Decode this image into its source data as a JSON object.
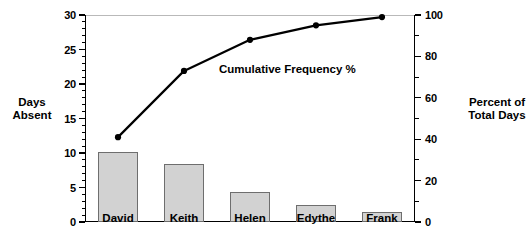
{
  "chart_data": {
    "type": "bar",
    "title": "",
    "categories": [
      "David",
      "Keith",
      "Helen",
      "Edythe",
      "Frank"
    ],
    "series": [
      {
        "name": "Days Absent",
        "type": "bar",
        "axis": "left",
        "values": [
          10.2,
          8.4,
          4.3,
          2.5,
          1.4
        ]
      },
      {
        "name": "Cumulative Frequency %",
        "type": "line",
        "axis": "right",
        "values": [
          41,
          73,
          88,
          95,
          99
        ]
      }
    ],
    "xlabel": "",
    "ylabel": "Days Absent",
    "y2label": "Percent of Total Days",
    "ylim": [
      0,
      30
    ],
    "y2lim": [
      0,
      100
    ],
    "yticks": [
      0,
      5,
      10,
      15,
      20,
      25,
      30
    ],
    "y2ticks": [
      0,
      20,
      40,
      60,
      80,
      100
    ],
    "yminor_step": 1,
    "y2minor_step": 10,
    "grid": false,
    "legend": "none",
    "annotations": [
      {
        "text": "Cumulative Frequency %"
      }
    ]
  },
  "axis_titles": {
    "left": "Days\nAbsent",
    "right": "Percent of\nTotal Days"
  },
  "annotation": {
    "series_label": "Cumulative Frequency %"
  },
  "colors": {
    "bar_fill": "#d2d2d2",
    "bar_stroke": "#6e6e6e",
    "line": "#000000",
    "axis": "#000000",
    "top_rule": "#b9b9b9",
    "background": "#ffffff"
  }
}
